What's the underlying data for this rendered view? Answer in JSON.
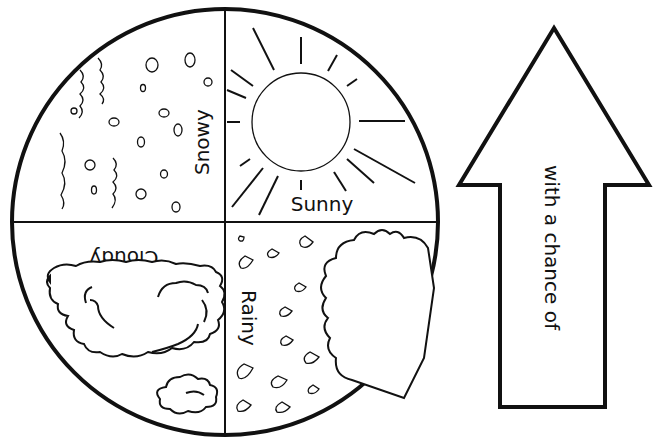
{
  "wheel": {
    "quadrants": [
      {
        "id": "snowy",
        "label": "Snowy",
        "position": "top-left",
        "rotation": -90
      },
      {
        "id": "sunny",
        "label": "Sunny",
        "position": "top-right",
        "rotation": 0
      },
      {
        "id": "cloudy",
        "label": "Cloudy",
        "position": "bottom-left",
        "rotation": 180
      },
      {
        "id": "rainy",
        "label": "Rainy",
        "position": "bottom-right",
        "rotation": 90
      }
    ]
  },
  "arrow": {
    "label": "with a chance of",
    "direction": "up"
  },
  "colors": {
    "ink": "#111111",
    "background": "#ffffff"
  }
}
